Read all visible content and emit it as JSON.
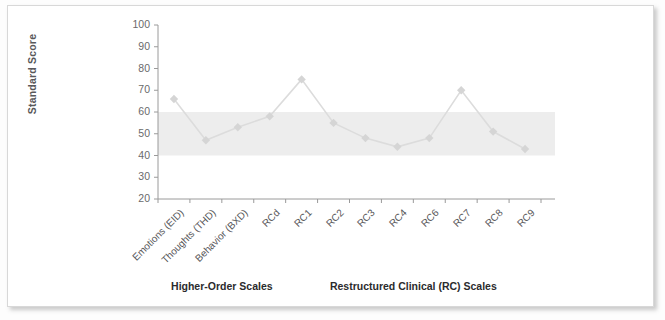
{
  "chart_data": {
    "type": "line",
    "title": "",
    "xlabel": "",
    "ylabel": "Standard Score",
    "ylim": [
      20,
      100
    ],
    "ytick_step": 10,
    "yticks": [
      100,
      90,
      80,
      70,
      60,
      50,
      40,
      30,
      20
    ],
    "grid": false,
    "legend": "none",
    "categories": [
      "Emotions (EID)",
      "Thoughts (THD)",
      "Behavior (BXD)",
      "RCd",
      "RC1",
      "RC2",
      "RC3",
      "RC4",
      "RC6",
      "RC7",
      "RC8",
      "RC9"
    ],
    "values": [
      66,
      47,
      53,
      58,
      75,
      55,
      48,
      44,
      48,
      70,
      51,
      43
    ],
    "series": [
      {
        "name": "Standard Score",
        "values": [
          66,
          47,
          53,
          58,
          75,
          55,
          48,
          44,
          48,
          70,
          51,
          43
        ]
      }
    ],
    "shaded_band": {
      "label": "normal range",
      "from": 40,
      "to": 60,
      "color": "#ededed"
    },
    "marker": "diamond",
    "line_color": "#dcdcdc",
    "marker_color": "#d5d5d5",
    "axis_color": "#9a9a9a"
  },
  "groups": [
    {
      "label": "Higher-Order Scales"
    },
    {
      "label": "Restructured Clinical (RC) Scales"
    }
  ],
  "colors": {
    "axis": "#9a9a9a",
    "band": "#ededed",
    "line": "#dcdcdc",
    "marker": "#d4d4d4",
    "tick_text": "#6a6a6c",
    "label_text": "#2b2b2d",
    "card_border": "#d8d8d8"
  }
}
